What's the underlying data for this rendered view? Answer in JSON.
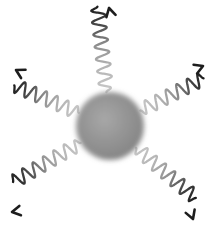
{
  "figure": {
    "title": "Nanoparticle emitting five wavy radiation arrows",
    "caption": "",
    "width": 214,
    "height": 229,
    "background_color": "#ffffff"
  },
  "sphere": {
    "name": "central-sphere",
    "label": "",
    "center_x": 110,
    "center_y": 126,
    "radius": 34,
    "edge_color": "#7c7c7c",
    "mid_color": "#8d8d8d",
    "highlight_color": "#a8a8a8",
    "blur_px": 3
  },
  "waves": {
    "stroke_width": 2.3,
    "start_color": "#c9c9c9",
    "mid_color": "#8f8f8f",
    "end_color": "#1d1d1d",
    "arrowhead_color": "#1d1d1d",
    "count": 5,
    "items": [
      {
        "id": "wave-arrow-top",
        "label": "top arrow",
        "direction": "up",
        "angle_deg": -96,
        "tip_x": 109,
        "tip_y": 8,
        "inner_radius": 34,
        "outer_radius": 120,
        "amplitude": 7,
        "cycles": 7.0,
        "head_angle_deg": -104
      },
      {
        "id": "wave-arrow-upper-left",
        "label": "upper left arrow",
        "direction": "up-left",
        "angle_deg": 203,
        "tip_x": 16,
        "tip_y": 70,
        "inner_radius": 34,
        "outer_radius": 104,
        "amplitude": 7,
        "cycles": 6.0,
        "head_angle_deg": 208
      },
      {
        "id": "wave-arrow-upper-right",
        "label": "upper right arrow",
        "direction": "up-right",
        "angle_deg": -27,
        "tip_x": 203,
        "tip_y": 66,
        "inner_radius": 34,
        "outer_radius": 105,
        "amplitude": 7,
        "cycles": 6.0,
        "head_angle_deg": -22
      },
      {
        "id": "wave-arrow-lower-left",
        "label": "lower left arrow",
        "direction": "down-left",
        "angle_deg": 150,
        "tip_x": 12,
        "tip_y": 212,
        "inner_radius": 34,
        "outer_radius": 112,
        "amplitude": 7,
        "cycles": 6.5,
        "head_angle_deg": 170
      },
      {
        "id": "wave-arrow-lower-right",
        "label": "lower right arrow",
        "direction": "down-right",
        "angle_deg": 40,
        "tip_x": 193,
        "tip_y": 219,
        "inner_radius": 34,
        "outer_radius": 112,
        "amplitude": 7,
        "cycles": 6.5,
        "head_angle_deg": 70
      }
    ]
  }
}
